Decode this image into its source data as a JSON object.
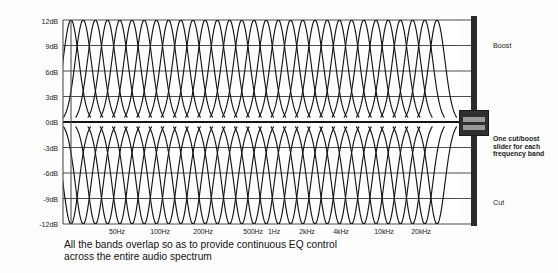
{
  "figure": {
    "title": "",
    "caption": "All the bands overlap so as to provide continuous EQ control across the entire audio spectrum"
  },
  "fader": {
    "boost_label": "Boost",
    "cut_label": "Cut",
    "note": "One cut/boost slider for each frequency band",
    "thumb_position_db": "0dB"
  },
  "colors": {
    "background": "#fdfdfd",
    "curve": "#141414",
    "grid": "#4d4d4d",
    "zero_line": "#141414",
    "fader_track": "#2b2b2b",
    "fader_thumb": "#2f2f2f",
    "fader_thumb_bar": "#9a9a9a",
    "text": "#1c1c1c"
  },
  "chart_data": {
    "type": "line",
    "title": "",
    "xlabel": "",
    "ylabel": "",
    "grid": true,
    "legend": "none",
    "ylim": [
      -12,
      12
    ],
    "yticks": [
      12,
      9,
      6,
      3,
      0,
      -3,
      -6,
      -9,
      -12
    ],
    "ytick_labels": [
      "12dB",
      "9dB",
      "6dB",
      "3dB",
      "0dB",
      "-3dB",
      "-6dB",
      "-9dB",
      "-12dB"
    ],
    "xtick_labels": [
      "50Hz",
      "100Hz",
      "200Hz",
      "500Hz",
      "1Hz",
      "2kHz",
      "4kHz",
      "10kHz",
      "20kHz"
    ],
    "xtick_positions_px": [
      117,
      160,
      203,
      253,
      272,
      305,
      340,
      383,
      420
    ],
    "band_count": 31,
    "band_peak_db": 12,
    "band_trough_db": -12,
    "series": [
      {
        "name": "boost curves",
        "peak_db": 12,
        "count": 31
      },
      {
        "name": "cut curves",
        "peak_db": -12,
        "count": 31
      }
    ]
  }
}
